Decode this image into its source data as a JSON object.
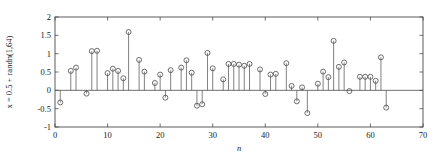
{
  "figure": {
    "background_color": "#ffffff",
    "axis_color": "#4a4a4a",
    "stem_color": "#555555"
  },
  "chart_data": {
    "type": "scatter",
    "plot_style": "stem",
    "title": "",
    "subtitle": "",
    "xlabel": "n",
    "ylabel": "x = 0.5 + randn(1,64)",
    "xlim": [
      0,
      70
    ],
    "ylim": [
      -1,
      2
    ],
    "xticks": [
      0,
      10,
      20,
      30,
      40,
      50,
      60,
      70
    ],
    "xticklabels": [
      "0",
      "10",
      "20",
      "30",
      "40",
      "50",
      "60",
      "70"
    ],
    "yticks": [
      -1,
      -0.5,
      0,
      0.5,
      1,
      1.5,
      2
    ],
    "yticklabels": [
      "-1",
      "-0.5",
      "0",
      "0.5",
      "1",
      "1.5",
      "2"
    ],
    "grid": false,
    "legend": null,
    "baseline": 0,
    "marker": "open-circle",
    "n_points": 64,
    "x": [
      1,
      2,
      3,
      4,
      5,
      6,
      7,
      8,
      9,
      10,
      11,
      12,
      13,
      14,
      15,
      16,
      17,
      18,
      19,
      20,
      21,
      22,
      23,
      24,
      25,
      26,
      27,
      28,
      29,
      30,
      31,
      32,
      33,
      34,
      35,
      36,
      37,
      38,
      39,
      40,
      41,
      42,
      43,
      44,
      45,
      46,
      47,
      48,
      49,
      50,
      51,
      52,
      53,
      54,
      55,
      56,
      57,
      58,
      59,
      60,
      61,
      62,
      63,
      64
    ],
    "values": [
      -0.33,
      0.0,
      0.53,
      0.62,
      0.0,
      -0.09,
      1.07,
      1.08,
      0.0,
      0.47,
      0.59,
      0.53,
      0.33,
      1.59,
      0.0,
      0.83,
      0.51,
      0.0,
      0.2,
      0.43,
      -0.2,
      0.55,
      0.0,
      0.62,
      0.82,
      0.48,
      -0.42,
      -0.38,
      1.02,
      0.6,
      0.0,
      0.3,
      0.72,
      0.72,
      0.7,
      0.67,
      0.72,
      0.0,
      0.57,
      -0.1,
      0.43,
      0.45,
      0.0,
      0.74,
      0.12,
      -0.3,
      0.08,
      -0.62,
      0.0,
      0.18,
      0.51,
      0.36,
      1.35,
      0.64,
      0.76,
      -0.02,
      0.0,
      0.37,
      0.37,
      0.37,
      0.26,
      0.9,
      -0.47,
      0.0
    ]
  }
}
